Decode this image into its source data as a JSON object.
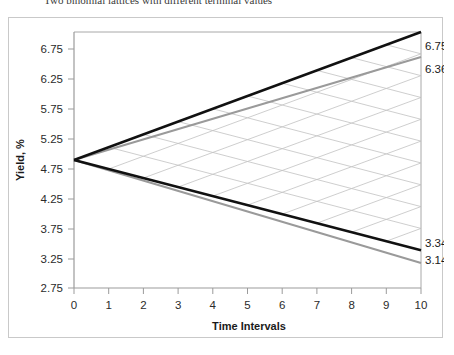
{
  "caption": "Two binomial lattices with different terminal values",
  "chart_data": {
    "type": "line",
    "title": "",
    "xlabel": "Time Intervals",
    "ylabel": "Yield, %",
    "xlim": [
      0,
      10
    ],
    "ylim": [
      2.75,
      6.75
    ],
    "xticks": [
      "0",
      "1",
      "2",
      "3",
      "4",
      "5",
      "6",
      "7",
      "8",
      "9",
      "10"
    ],
    "yticks": [
      "2.75",
      "3.25",
      "3.75",
      "4.25",
      "4.75",
      "5.25",
      "5.75",
      "6.25",
      "6.75"
    ],
    "grid": false,
    "legend": "none",
    "start_value": 4.75,
    "series": [
      {
        "name": "lattice-black-upper",
        "color": "#111111",
        "x": [
          0,
          10
        ],
        "values": [
          4.75,
          6.75
        ],
        "end_label": "6.75"
      },
      {
        "name": "lattice-gray-upper",
        "color": "#9a9a9a",
        "x": [
          0,
          10
        ],
        "values": [
          4.75,
          6.36
        ],
        "end_label": "6.36"
      },
      {
        "name": "lattice-black-lower",
        "color": "#111111",
        "x": [
          0,
          10
        ],
        "values": [
          4.75,
          3.34
        ],
        "end_label": "3.34"
      },
      {
        "name": "lattice-gray-lower",
        "color": "#9a9a9a",
        "x": [
          0,
          10
        ],
        "values": [
          4.75,
          3.14
        ],
        "end_label": "3.14"
      }
    ],
    "annotations": [
      {
        "text": "6.75",
        "x": 10,
        "y": 6.75
      },
      {
        "text": "6.36",
        "x": 10,
        "y": 6.36
      },
      {
        "text": "3.34",
        "x": 10,
        "y": 3.34
      },
      {
        "text": "3.14",
        "x": 10,
        "y": 3.14
      }
    ],
    "lattice": {
      "steps": 10,
      "node_line_color": "#bdbdbd",
      "description": "recombining binomial lattice fan between upper and lower envelopes"
    }
  }
}
